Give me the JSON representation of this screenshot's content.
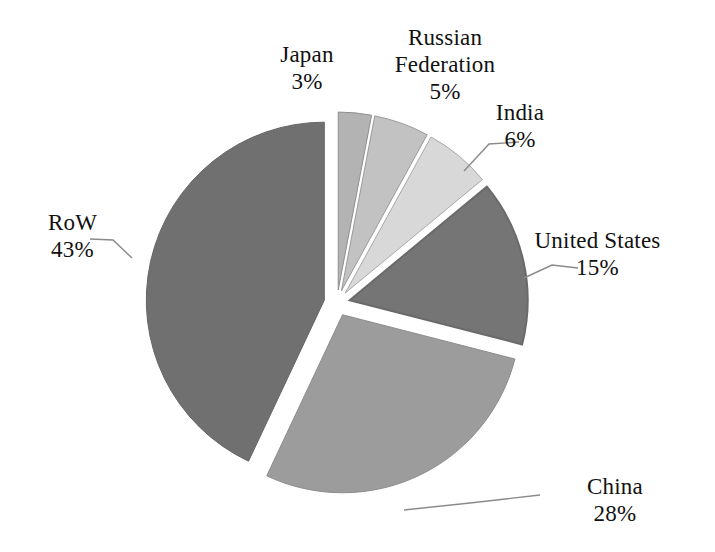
{
  "chart_data": {
    "type": "pie",
    "title": "",
    "categories": [
      "Japan",
      "Russian Federation",
      "India",
      "United States",
      "China",
      "RoW"
    ],
    "values": [
      3,
      5,
      6,
      15,
      28,
      43
    ],
    "unit": "%",
    "legend": "none",
    "exploded": true,
    "start_angle_deg": 0,
    "direction": "clockwise",
    "slices": [
      {
        "label": "Japan",
        "value": 3,
        "value_text": "3%",
        "color": "#b3b3b3",
        "outline": "#8f8f8f",
        "leader_line": false
      },
      {
        "label": "Russian Federation",
        "value": 5,
        "value_text": "5%",
        "color": "#c2c2c2",
        "outline": "#9a9a9a",
        "leader_line": false
      },
      {
        "label": "India",
        "value": 6,
        "value_text": "6%",
        "color": "#d8d8d8",
        "outline": "#a8a8a8",
        "leader_line": true
      },
      {
        "label": "United States",
        "value": 15,
        "value_text": "15%",
        "color": "#757575",
        "outline": "#6a6a6a",
        "leader_line": true
      },
      {
        "label": "China",
        "value": 28,
        "value_text": "28%",
        "color": "#9c9c9c",
        "outline": "#8d8d8d",
        "leader_line": true
      },
      {
        "label": "RoW",
        "value": 43,
        "value_text": "43%",
        "color": "#707070",
        "outline": "#666666",
        "leader_line": true
      }
    ]
  },
  "labels": {
    "japan": {
      "name": "Japan",
      "value": "3%"
    },
    "russia": {
      "name": "Russian Federation",
      "name_line1": "Russian",
      "name_line2": "Federation",
      "value": "5%"
    },
    "india": {
      "name": "India",
      "value": "6%"
    },
    "us": {
      "name": "United States",
      "value": "15%"
    },
    "china": {
      "name": "China",
      "value": "28%"
    },
    "row": {
      "name": "RoW",
      "value": "43%"
    }
  },
  "colors": {
    "background": "#ffffff",
    "text": "#111111",
    "leader_line": "#8a8a8a"
  }
}
